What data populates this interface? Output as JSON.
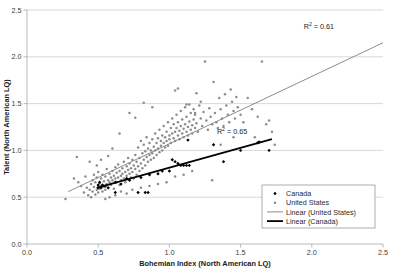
{
  "chart_data": {
    "type": "scatter",
    "title": "",
    "xlabel": "Bohemian Index (North American LQ)",
    "ylabel": "Talent (North American LQ)",
    "xlim": [
      0.0,
      2.5
    ],
    "ylim": [
      0.0,
      2.5
    ],
    "xticks": [
      "0.0",
      "0.5",
      "1.0",
      "1.5",
      "2.0",
      "2.5"
    ],
    "yticks": [
      "0.0",
      "0.5",
      "1.0",
      "1.5",
      "2.0",
      "2.5"
    ],
    "xtick_values": [
      0.0,
      0.5,
      1.0,
      1.5,
      2.0,
      2.5
    ],
    "ytick_values": [
      0.0,
      0.5,
      1.0,
      1.5,
      2.0,
      2.5
    ],
    "grid": "horizontal",
    "legend_position": "lower-right",
    "annotations": [
      {
        "name": "r2-united-states",
        "text_prefix": "R",
        "text_sup": "2",
        "text_suffix": " = 0.61",
        "value": 0.61,
        "series": "United States",
        "x": 2.05,
        "y": 2.3
      },
      {
        "name": "r2-canada",
        "text_prefix": "R",
        "text_sup": "2",
        "text_suffix": " = 0.65",
        "value": 0.65,
        "series": "Canada",
        "x": 1.44,
        "y": 1.17
      }
    ],
    "series": [
      {
        "name": "Canada",
        "type": "scatter",
        "marker": "diamond",
        "color": "#000000",
        "points": [
          [
            0.5,
            0.6
          ],
          [
            0.5,
            0.63
          ],
          [
            0.51,
            0.66
          ],
          [
            0.52,
            0.6
          ],
          [
            0.53,
            0.63
          ],
          [
            0.55,
            0.62
          ],
          [
            0.57,
            0.6
          ],
          [
            0.62,
            0.55
          ],
          [
            0.62,
            0.66
          ],
          [
            0.66,
            0.64
          ],
          [
            0.7,
            0.7
          ],
          [
            0.72,
            0.68
          ],
          [
            0.78,
            0.55
          ],
          [
            0.8,
            0.71
          ],
          [
            0.83,
            0.55
          ],
          [
            0.85,
            0.55
          ],
          [
            0.86,
            0.74
          ],
          [
            0.92,
            0.75
          ],
          [
            0.95,
            0.78
          ],
          [
            1.0,
            0.78
          ],
          [
            1.02,
            0.9
          ],
          [
            1.04,
            0.88
          ],
          [
            1.06,
            0.86
          ],
          [
            1.08,
            0.84
          ],
          [
            1.1,
            0.84
          ],
          [
            1.12,
            0.84
          ],
          [
            1.13,
            1.11
          ],
          [
            1.31,
            1.06
          ],
          [
            1.38,
            0.88
          ],
          [
            1.5,
            1.0
          ],
          [
            1.62,
            1.08
          ],
          [
            1.63,
            1.09
          ],
          [
            1.7,
            1.0
          ],
          [
            1.14,
            0.84
          ]
        ]
      },
      {
        "name": "United States",
        "type": "scatter",
        "marker": "circle",
        "color": "#8c8c8c",
        "points": [
          [
            0.27,
            0.48
          ],
          [
            0.33,
            0.7
          ],
          [
            0.35,
            0.93
          ],
          [
            0.36,
            0.66
          ],
          [
            0.38,
            0.62
          ],
          [
            0.4,
            0.55
          ],
          [
            0.41,
            0.72
          ],
          [
            0.42,
            0.6
          ],
          [
            0.43,
            0.52
          ],
          [
            0.44,
            0.58
          ],
          [
            0.45,
            0.64
          ],
          [
            0.45,
            0.5
          ],
          [
            0.46,
            0.68
          ],
          [
            0.46,
            0.56
          ],
          [
            0.47,
            0.61
          ],
          [
            0.47,
            0.74
          ],
          [
            0.48,
            0.53
          ],
          [
            0.48,
            0.66
          ],
          [
            0.49,
            0.58
          ],
          [
            0.49,
            0.71
          ],
          [
            0.5,
            0.62
          ],
          [
            0.5,
            0.55
          ],
          [
            0.5,
            0.77
          ],
          [
            0.51,
            0.65
          ],
          [
            0.51,
            0.59
          ],
          [
            0.52,
            0.7
          ],
          [
            0.52,
            0.62
          ],
          [
            0.53,
            0.56
          ],
          [
            0.53,
            0.74
          ],
          [
            0.54,
            0.67
          ],
          [
            0.54,
            0.61
          ],
          [
            0.55,
            0.58
          ],
          [
            0.55,
            0.72
          ],
          [
            0.56,
            0.64
          ],
          [
            0.56,
            0.8
          ],
          [
            0.57,
            0.68
          ],
          [
            0.57,
            0.6
          ],
          [
            0.58,
            0.75
          ],
          [
            0.58,
            0.66
          ],
          [
            0.59,
            0.71
          ],
          [
            0.59,
            0.63
          ],
          [
            0.6,
            0.78
          ],
          [
            0.6,
            0.68
          ],
          [
            0.61,
            0.73
          ],
          [
            0.61,
            0.59
          ],
          [
            0.62,
            0.82
          ],
          [
            0.62,
            0.7
          ],
          [
            0.63,
            0.76
          ],
          [
            0.63,
            0.66
          ],
          [
            0.64,
            0.71
          ],
          [
            0.64,
            0.85
          ],
          [
            0.65,
            0.63
          ],
          [
            0.65,
            0.78
          ],
          [
            0.66,
            0.73
          ],
          [
            0.66,
            0.68
          ],
          [
            0.67,
            0.81
          ],
          [
            0.67,
            0.75
          ],
          [
            0.68,
            0.7
          ],
          [
            0.68,
            0.88
          ],
          [
            0.69,
            0.77
          ],
          [
            0.69,
            0.66
          ],
          [
            0.7,
            0.83
          ],
          [
            0.7,
            0.73
          ],
          [
            0.71,
            0.79
          ],
          [
            0.71,
            0.92
          ],
          [
            0.72,
            0.75
          ],
          [
            0.72,
            0.86
          ],
          [
            0.73,
            0.71
          ],
          [
            0.73,
            0.81
          ],
          [
            0.74,
            0.9
          ],
          [
            0.74,
            0.77
          ],
          [
            0.75,
            0.84
          ],
          [
            0.75,
            0.7
          ],
          [
            0.76,
            0.95
          ],
          [
            0.76,
            0.8
          ],
          [
            0.77,
            0.88
          ],
          [
            0.77,
            0.74
          ],
          [
            0.78,
            1.03
          ],
          [
            0.78,
            0.83
          ],
          [
            0.79,
            0.92
          ],
          [
            0.79,
            0.78
          ],
          [
            0.8,
            1.1
          ],
          [
            0.8,
            0.86
          ],
          [
            0.81,
            0.97
          ],
          [
            0.81,
            0.81
          ],
          [
            0.82,
            1.06
          ],
          [
            0.82,
            0.9
          ],
          [
            0.83,
            0.99
          ],
          [
            0.83,
            0.84
          ],
          [
            0.84,
            1.14
          ],
          [
            0.84,
            0.93
          ],
          [
            0.85,
            1.02
          ],
          [
            0.85,
            0.88
          ],
          [
            0.86,
            1.08
          ],
          [
            0.86,
            0.95
          ],
          [
            0.87,
            1.0
          ],
          [
            0.87,
            0.9
          ],
          [
            0.88,
            1.12
          ],
          [
            0.88,
            0.97
          ],
          [
            0.89,
            1.04
          ],
          [
            0.89,
            0.92
          ],
          [
            0.9,
            1.18
          ],
          [
            0.9,
            1.0
          ],
          [
            0.91,
            1.08
          ],
          [
            0.91,
            0.95
          ],
          [
            0.92,
            1.13
          ],
          [
            0.92,
            1.02
          ],
          [
            0.93,
            1.22
          ],
          [
            0.93,
            0.98
          ],
          [
            0.94,
            1.1
          ],
          [
            0.94,
            1.05
          ],
          [
            0.95,
            1.16
          ],
          [
            0.95,
            1.0
          ],
          [
            0.96,
            1.26
          ],
          [
            0.96,
            1.08
          ],
          [
            0.97,
            1.14
          ],
          [
            0.97,
            1.03
          ],
          [
            0.98,
            1.2
          ],
          [
            0.98,
            1.1
          ],
          [
            0.99,
            1.3
          ],
          [
            0.99,
            1.05
          ],
          [
            1.0,
            1.16
          ],
          [
            1.0,
            1.12
          ],
          [
            1.01,
            1.24
          ],
          [
            1.01,
            1.08
          ],
          [
            1.02,
            1.34
          ],
          [
            1.02,
            1.18
          ],
          [
            1.03,
            1.13
          ],
          [
            1.03,
            1.28
          ],
          [
            1.04,
            1.2
          ],
          [
            1.04,
            1.1
          ],
          [
            1.05,
            1.38
          ],
          [
            1.05,
            1.24
          ],
          [
            1.06,
            1.16
          ],
          [
            1.06,
            1.3
          ],
          [
            1.07,
            1.21
          ],
          [
            1.07,
            1.12
          ],
          [
            1.08,
            1.42
          ],
          [
            1.08,
            1.26
          ],
          [
            1.09,
            1.18
          ],
          [
            1.09,
            1.33
          ],
          [
            1.1,
            1.23
          ],
          [
            1.1,
            1.14
          ],
          [
            1.11,
            1.46
          ],
          [
            1.11,
            1.28
          ],
          [
            1.12,
            1.2
          ],
          [
            1.12,
            1.36
          ],
          [
            1.13,
            1.25
          ],
          [
            1.13,
            1.16
          ],
          [
            1.14,
            1.49
          ],
          [
            1.14,
            1.31
          ],
          [
            1.15,
            1.22
          ],
          [
            1.15,
            1.4
          ],
          [
            1.16,
            1.27
          ],
          [
            1.16,
            1.18
          ],
          [
            1.17,
            1.44
          ],
          [
            1.17,
            1.33
          ],
          [
            1.18,
            1.24
          ],
          [
            1.18,
            1.38
          ],
          [
            1.19,
            1.29
          ],
          [
            1.2,
            1.2
          ],
          [
            1.21,
            1.48
          ],
          [
            1.22,
            1.34
          ],
          [
            1.23,
            1.26
          ],
          [
            1.24,
            1.41
          ],
          [
            1.25,
            1.95
          ],
          [
            1.26,
            1.32
          ],
          [
            1.27,
            1.22
          ],
          [
            1.28,
            1.45
          ],
          [
            1.29,
            1.36
          ],
          [
            1.3,
            1.28
          ],
          [
            1.31,
            1.73
          ],
          [
            1.32,
            1.4
          ],
          [
            1.33,
            1.3
          ],
          [
            1.34,
            1.24
          ],
          [
            1.35,
            1.56
          ],
          [
            1.36,
            1.44
          ],
          [
            1.37,
            1.34
          ],
          [
            1.38,
            1.26
          ],
          [
            1.39,
            1.6
          ],
          [
            1.4,
            1.48
          ],
          [
            1.41,
            1.38
          ],
          [
            1.42,
            1.3
          ],
          [
            1.43,
            1.65
          ],
          [
            1.44,
            1.52
          ],
          [
            1.45,
            1.42
          ],
          [
            1.46,
            1.34
          ],
          [
            1.47,
            1.57
          ],
          [
            1.48,
            1.46
          ],
          [
            1.5,
            1.38
          ],
          [
            1.52,
            1.3
          ],
          [
            1.55,
            1.56
          ],
          [
            1.58,
            1.44
          ],
          [
            1.6,
            1.14
          ],
          [
            1.62,
            1.36
          ],
          [
            1.65,
            1.95
          ],
          [
            1.68,
            1.28
          ],
          [
            1.7,
            1.32
          ],
          [
            1.72,
            1.2
          ],
          [
            1.74,
            1.06
          ],
          [
            1.3,
            0.68
          ],
          [
            1.36,
            1.06
          ],
          [
            1.45,
            1.14
          ],
          [
            0.6,
            1.02
          ],
          [
            0.65,
            1.18
          ],
          [
            0.72,
            1.4
          ],
          [
            0.76,
            1.35
          ],
          [
            0.82,
            1.51
          ],
          [
            0.88,
            1.46
          ],
          [
            1.04,
            1.64
          ],
          [
            1.06,
            1.66
          ],
          [
            1.12,
            1.49
          ],
          [
            1.19,
            1.61
          ],
          [
            1.22,
            1.52
          ],
          [
            1.18,
            1.4
          ],
          [
            0.58,
            0.5
          ],
          [
            0.55,
            0.48
          ],
          [
            0.62,
            0.52
          ],
          [
            0.66,
            0.56
          ],
          [
            0.7,
            0.54
          ],
          [
            0.74,
            0.58
          ],
          [
            0.8,
            0.6
          ],
          [
            0.86,
            0.62
          ],
          [
            0.92,
            0.64
          ],
          [
            0.98,
            0.66
          ],
          [
            1.04,
            0.72
          ],
          [
            1.1,
            0.74
          ],
          [
            1.16,
            0.78
          ],
          [
            0.44,
            0.88
          ],
          [
            0.49,
            0.84
          ],
          [
            0.52,
            0.9
          ],
          [
            0.57,
            0.94
          ]
        ]
      },
      {
        "name": "Linear (United States)",
        "type": "line",
        "color": "#8c8c8c",
        "width": 1,
        "x0": 0.29,
        "y0": 0.56,
        "x1": 2.5,
        "y1": 2.15
      },
      {
        "name": "Linear (Canada)",
        "type": "line",
        "color": "#000000",
        "width": 1.7,
        "x0": 0.49,
        "y0": 0.6,
        "x1": 1.72,
        "y1": 1.12
      }
    ],
    "legend": [
      {
        "label": "Canada",
        "marker": "diamond",
        "color": "#000000"
      },
      {
        "label": "United States",
        "marker": "circle",
        "color": "#8c8c8c"
      },
      {
        "label": "Linear (United States)",
        "marker": "line",
        "color": "#8c8c8c"
      },
      {
        "label": "Linear (Canada)",
        "marker": "line-bold",
        "color": "#000000"
      }
    ]
  },
  "colors": {
    "canada": "#000000",
    "united_states": "#8c8c8c",
    "grid": "#c9c9c9",
    "axis": "#a8a8a8",
    "text": "#2a2a2a",
    "background": "#ffffff"
  }
}
